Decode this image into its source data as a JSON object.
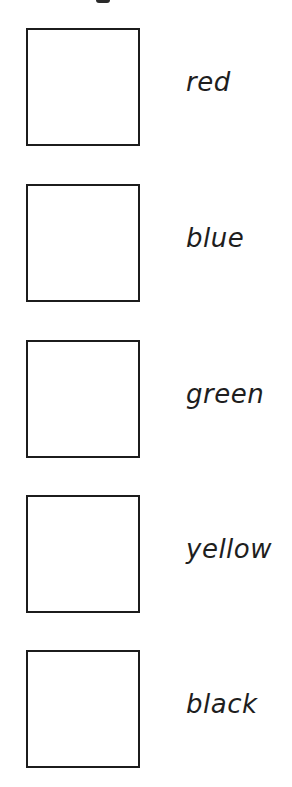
{
  "worksheet": {
    "items": [
      {
        "label": "red",
        "box_checked": false
      },
      {
        "label": "blue",
        "box_checked": false
      },
      {
        "label": "green",
        "box_checked": false
      },
      {
        "label": "yellow",
        "box_checked": false
      },
      {
        "label": "black",
        "box_checked": false
      }
    ]
  },
  "colors": {
    "border": "#1c1c1c",
    "text": "#1e1e1e",
    "background": "#ffffff"
  }
}
